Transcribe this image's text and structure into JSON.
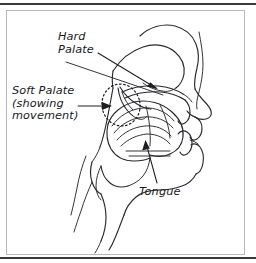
{
  "figure": {
    "name": "vocal-tract-sagittal-diagram",
    "style": "hand-drawn line art",
    "ink_color": "#2a2a2e",
    "background_color": "#ffffff",
    "frame_color": "#b8b8bd",
    "rule_color": "#3a3a3a"
  },
  "labels": {
    "hard_palate": {
      "lines": [
        "Hard",
        "Palate"
      ],
      "text": "Hard\nPalate"
    },
    "soft_palate": {
      "lines": [
        "Soft Palate",
        "(showing",
        "movement)"
      ],
      "text": "Soft Palate\n(showing\nmovement)"
    },
    "tongue": {
      "lines": [
        "Tongue"
      ],
      "text": "Tongue"
    }
  },
  "annotations": {
    "hard_palate_leader": "leader-line-with-arrowhead",
    "soft_palate_leader": "leader-line-with-arrowhead",
    "tongue_leader": "leader-line-with-arrowhead",
    "soft_palate_movement_marker": "dotted-ellipse"
  },
  "anatomy_parts": [
    "nasal-cavity",
    "hard-palate",
    "soft-palate",
    "velum",
    "tongue",
    "tongue-muscle-striations",
    "teeth",
    "upper-lip",
    "lower-lip",
    "jaw",
    "chin",
    "neck",
    "pharynx",
    "nose-profile",
    "face-profile"
  ]
}
